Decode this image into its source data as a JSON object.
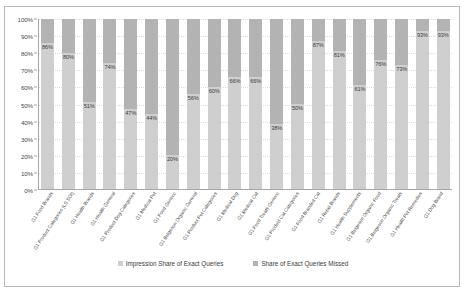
{
  "chart_data": {
    "type": "bar",
    "title": "",
    "xlabel": "",
    "ylabel": "",
    "ylim": [
      0,
      100
    ],
    "ytick_labels": [
      "100%",
      "90%",
      "80%",
      "70%",
      "60%",
      "50%",
      "40%",
      "30%",
      "20%",
      "10%",
      "0%"
    ],
    "ytick_values": [
      100,
      90,
      80,
      70,
      60,
      50,
      40,
      30,
      20,
      10,
      0
    ],
    "grid": true,
    "stacked": true,
    "legend_position": "bottom",
    "colors": {
      "impression_share": "#cfcfcf",
      "share_missed": "#b3b3b3",
      "axis": "#a6a6a6",
      "gridline": "#dedede",
      "text": "#3b3b3b",
      "frame": "#b9b9b9"
    },
    "categories": [
      "G1 Food Brands",
      "G1 Product Categories (LS SOI)",
      "G1 Health Brands",
      "G1 Health General",
      "G1 Product Dog Categories",
      "G1 Medical Pet",
      "G1 Food Generic",
      "G1 Belgeson Organic General",
      "G1 Product Pet Categories",
      "G1 Medical Dog",
      "G1 Medical Cat",
      "G1 Food Treats Generic",
      "G1 Product Cat Categories",
      "G1 Food Branded Cat",
      "G1 Retail Brands",
      "G1 Health Supplements",
      "G1 Belgeson Organic Food",
      "G1 Belgeson Organic Treats",
      "G1 Health Pet Remedies",
      "G1 Dog Brand"
    ],
    "series": [
      {
        "name": "Impression Share of Exact Queries",
        "values": [
          86,
          80,
          51,
          74,
          47,
          44,
          20,
          56,
          60,
          66,
          66,
          38,
          50,
          87,
          81,
          61,
          76,
          73,
          93,
          93
        ]
      },
      {
        "name": "Share of Exact Queries Missed",
        "values": [
          14,
          20,
          49,
          26,
          53,
          56,
          80,
          44,
          40,
          34,
          34,
          62,
          50,
          13,
          19,
          39,
          24,
          27,
          7,
          7
        ]
      }
    ],
    "data_labels": [
      "86%",
      "80%",
      "51%",
      "74%",
      "47%",
      "44%",
      "20%",
      "56%",
      "60%",
      "66%",
      "66%",
      "38%",
      "50%",
      "87%",
      "81%",
      "61%",
      "76%",
      "73%",
      "93%",
      "93%"
    ]
  },
  "legend": {
    "items": [
      {
        "label": "Impression Share of Exact Queries",
        "color": "#cfcfcf"
      },
      {
        "label": "Share of Exact Queries Missed",
        "color": "#b3b3b3"
      }
    ]
  }
}
